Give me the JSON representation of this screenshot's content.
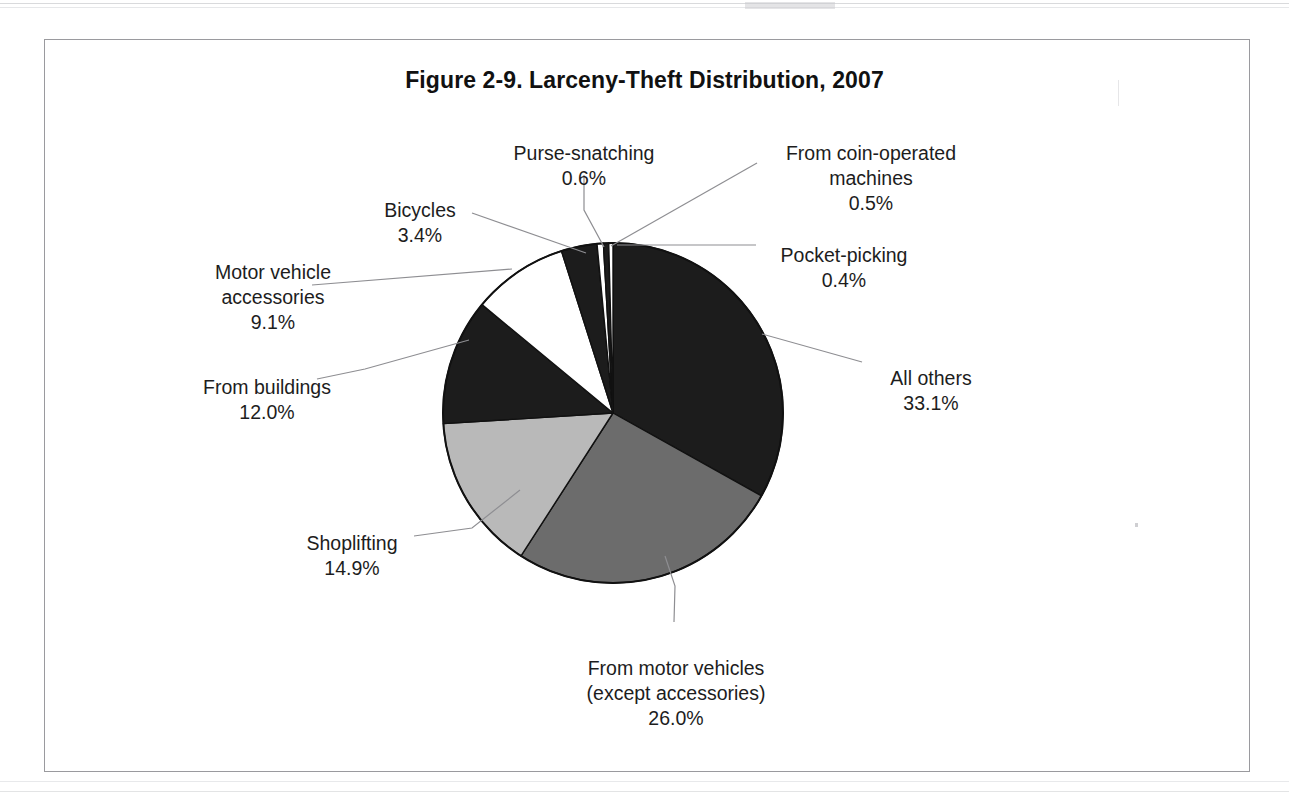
{
  "figure": {
    "title": "Figure 2-9. Larceny-Theft Distribution, 2007"
  },
  "chart_data": {
    "type": "pie",
    "title": "Figure 2-9. Larceny-Theft Distribution, 2007",
    "unit": "percent",
    "legend_position": "none (labels with leader lines)",
    "grid": false,
    "start_angle_deg": 0,
    "direction": "clockwise",
    "categories": [
      "All others",
      "From motor vehicles (except accessories)",
      "Shoplifting",
      "From buildings",
      "Motor vehicle accessories",
      "Bicycles",
      "Purse-snatching",
      "From coin-operated machines",
      "Pocket-picking"
    ],
    "values": [
      33.1,
      26.0,
      14.9,
      12.0,
      9.1,
      3.4,
      0.6,
      0.5,
      0.4
    ],
    "value_labels": [
      "33.1%",
      "26.0%",
      "14.9%",
      "12.0%",
      "9.1%",
      "3.4%",
      "0.6%",
      "0.5%",
      "0.4%"
    ],
    "slice_colors": [
      "#1c1c1c",
      "#6c6c6c",
      "#b9b9b9",
      "#1c1c1c",
      "#ffffff",
      "#1c1c1c",
      "#ffffff",
      "#1c1c1c",
      "#ffffff"
    ],
    "slices": [
      {
        "name": "All others",
        "value": 33.1,
        "label": "All others",
        "value_label": "33.1%",
        "color": "#1c1c1c"
      },
      {
        "name": "From motor vehicles (except accessories)",
        "value": 26.0,
        "label": "From motor vehicles\n(except accessories)",
        "value_label": "26.0%",
        "color": "#6c6c6c"
      },
      {
        "name": "Shoplifting",
        "value": 14.9,
        "label": "Shoplifting",
        "value_label": "14.9%",
        "color": "#b9b9b9"
      },
      {
        "name": "From buildings",
        "value": 12.0,
        "label": "From buildings",
        "value_label": "12.0%",
        "color": "#1c1c1c"
      },
      {
        "name": "Motor vehicle accessories",
        "value": 9.1,
        "label": "Motor vehicle\naccessories",
        "value_label": "9.1%",
        "color": "#ffffff"
      },
      {
        "name": "Bicycles",
        "value": 3.4,
        "label": "Bicycles",
        "value_label": "3.4%",
        "color": "#1c1c1c"
      },
      {
        "name": "Purse-snatching",
        "value": 0.6,
        "label": "Purse-snatching",
        "value_label": "0.6%",
        "color": "#ffffff"
      },
      {
        "name": "From coin-operated machines",
        "value": 0.5,
        "label": "From coin-operated\nmachines",
        "value_label": "0.5%",
        "color": "#1c1c1c"
      },
      {
        "name": "Pocket-picking",
        "value": 0.4,
        "label": "Pocket-picking",
        "value_label": "0.4%",
        "color": "#ffffff"
      }
    ]
  },
  "labels": {
    "purse_snatching": {
      "name": "Purse-snatching",
      "pct": "0.6%"
    },
    "coin_operated": {
      "name": "From coin-operated\nmachines",
      "pct": "0.5%"
    },
    "bicycles": {
      "name": "Bicycles",
      "pct": "3.4%"
    },
    "pocket_picking": {
      "name": "Pocket-picking",
      "pct": "0.4%"
    },
    "motor_accessories": {
      "name": "Motor vehicle\naccessories",
      "pct": "9.1%"
    },
    "all_others": {
      "name": "All others",
      "pct": "33.1%"
    },
    "from_buildings": {
      "name": "From buildings",
      "pct": "12.0%"
    },
    "shoplifting": {
      "name": "Shoplifting",
      "pct": "14.9%"
    },
    "from_motor": {
      "name": "From motor vehicles\n(except accessories)",
      "pct": "26.0%"
    }
  },
  "geometry": {
    "center_x": 613,
    "center_y": 413,
    "radius": 170
  },
  "colors": {
    "dark_slice": "#1c1c1c",
    "mid_slice": "#6c6c6c",
    "light_slice": "#b9b9b9",
    "white_slice": "#ffffff",
    "outline": "#111111",
    "leader_line": "#8e8e92",
    "frame": "#9a9a9e"
  }
}
